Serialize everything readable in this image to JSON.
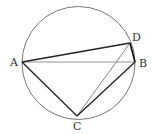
{
  "diagram": {
    "type": "geometry",
    "circle": {
      "cx": 78.5,
      "cy": 63,
      "r": 56.5,
      "color": "#666666"
    },
    "points": [
      {
        "id": "A",
        "label": "A",
        "x": 22,
        "y": 62,
        "lx": 10,
        "ly": 66
      },
      {
        "id": "B",
        "label": "B",
        "x": 135,
        "y": 62,
        "lx": 139,
        "ly": 67
      },
      {
        "id": "C",
        "label": "C",
        "x": 77,
        "y": 116,
        "lx": 73,
        "ly": 130
      },
      {
        "id": "D",
        "label": "D",
        "x": 130,
        "y": 43,
        "lx": 132,
        "ly": 41
      }
    ],
    "segments": [
      {
        "from": "A",
        "to": "D",
        "weight": "bold"
      },
      {
        "from": "A",
        "to": "B",
        "weight": "thin"
      },
      {
        "from": "A",
        "to": "C",
        "weight": "bold"
      },
      {
        "from": "C",
        "to": "D",
        "weight": "thin"
      },
      {
        "from": "C",
        "to": "B",
        "weight": "bold"
      },
      {
        "from": "D",
        "to": "B",
        "weight": "bold"
      }
    ]
  }
}
